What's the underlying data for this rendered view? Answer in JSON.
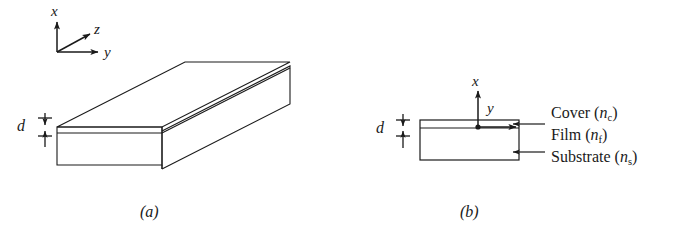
{
  "figure": {
    "background_color": "#ffffff",
    "line_color": "#1a1a1a",
    "panels": [
      {
        "id": "a",
        "caption": "(a)",
        "kind": "3d-slab-waveguide",
        "axes": [
          {
            "name": "x-axis-label",
            "label": "x",
            "direction": "up"
          },
          {
            "name": "z-axis-label",
            "label": "z",
            "direction": "up-right-diagonal"
          },
          {
            "name": "y-axis-label",
            "label": "y",
            "direction": "right"
          }
        ],
        "dimension": {
          "label": "d",
          "meaning": "film thickness"
        }
      },
      {
        "id": "b",
        "caption": "(b)",
        "kind": "cross-section",
        "axes": [
          {
            "name": "x-axis-label",
            "label": "x",
            "direction": "up"
          },
          {
            "name": "y-axis-label",
            "label": "y",
            "direction": "right"
          }
        ],
        "dimension": {
          "label": "d",
          "meaning": "film thickness"
        },
        "layers": [
          {
            "name": "cover",
            "label": "Cover",
            "index_symbol": "n",
            "index_subscript": "c"
          },
          {
            "name": "film",
            "label": "Film",
            "index_symbol": "n",
            "index_subscript": "f"
          },
          {
            "name": "substrate",
            "label": "Substrate",
            "index_symbol": "n",
            "index_subscript": "s"
          }
        ]
      }
    ]
  }
}
